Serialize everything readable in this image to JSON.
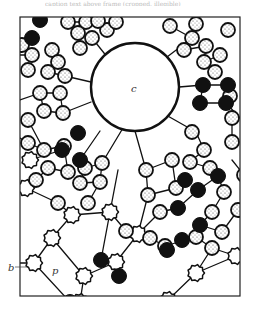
{
  "figure": {
    "type": "schematic illustration of particle network",
    "frame": {
      "x": 20,
      "y": 17,
      "width": 220,
      "height": 279
    },
    "colors": {
      "ink": "#111111",
      "background": "#ffffff",
      "stipple": "#555555",
      "label": "#333333"
    },
    "labels": {
      "c": {
        "text": "c",
        "x": 131,
        "y": 92
      },
      "b": {
        "text": "b",
        "x": 8,
        "y": 271
      },
      "p": {
        "text": "p",
        "x": 52,
        "y": 274
      }
    },
    "large_particle": {
      "id": "c",
      "cx": 135,
      "cy": 87,
      "r": 44
    },
    "stippled_particles": [
      [
        68,
        22
      ],
      [
        86,
        22
      ],
      [
        78,
        33
      ],
      [
        92,
        38
      ],
      [
        80,
        48
      ],
      [
        107,
        30
      ],
      [
        116,
        22
      ],
      [
        98,
        21
      ],
      [
        22,
        45
      ],
      [
        32,
        55
      ],
      [
        28,
        70
      ],
      [
        52,
        50
      ],
      [
        58,
        62
      ],
      [
        48,
        72
      ],
      [
        65,
        76
      ],
      [
        40,
        93
      ],
      [
        60,
        93
      ],
      [
        44,
        111
      ],
      [
        63,
        113
      ],
      [
        28,
        120
      ],
      [
        28,
        143
      ],
      [
        44,
        150
      ],
      [
        64,
        146
      ],
      [
        48,
        168
      ],
      [
        68,
        172
      ],
      [
        36,
        180
      ],
      [
        85,
        168
      ],
      [
        102,
        163
      ],
      [
        100,
        182
      ],
      [
        80,
        183
      ],
      [
        88,
        203
      ],
      [
        58,
        203
      ],
      [
        170,
        26
      ],
      [
        192,
        38
      ],
      [
        184,
        50
      ],
      [
        206,
        46
      ],
      [
        204,
        62
      ],
      [
        220,
        55
      ],
      [
        215,
        72
      ],
      [
        228,
        30
      ],
      [
        196,
        24
      ],
      [
        230,
        96
      ],
      [
        232,
        118
      ],
      [
        232,
        142
      ],
      [
        192,
        132
      ],
      [
        204,
        150
      ],
      [
        190,
        162
      ],
      [
        210,
        168
      ],
      [
        146,
        170
      ],
      [
        172,
        160
      ],
      [
        148,
        195
      ],
      [
        176,
        188
      ],
      [
        224,
        192
      ],
      [
        212,
        212
      ],
      [
        222,
        232
      ],
      [
        238,
        210
      ],
      [
        126,
        231
      ],
      [
        160,
        212
      ],
      [
        150,
        238
      ],
      [
        165,
        246
      ],
      [
        196,
        237
      ],
      [
        212,
        248
      ],
      [
        244,
        175
      ]
    ],
    "solid_particles": [
      [
        40,
        20
      ],
      [
        32,
        38
      ],
      [
        203,
        85
      ],
      [
        228,
        85
      ],
      [
        200,
        103
      ],
      [
        226,
        103
      ],
      [
        78,
        133
      ],
      [
        62,
        150
      ],
      [
        80,
        160
      ],
      [
        185,
        180
      ],
      [
        178,
        208
      ],
      [
        218,
        176
      ],
      [
        200,
        225
      ],
      [
        101,
        260
      ],
      [
        119,
        276
      ],
      [
        167,
        250
      ],
      [
        182,
        240
      ],
      [
        70,
        302
      ],
      [
        198,
        190
      ]
    ],
    "spiky_particles": [
      [
        30,
        160
      ],
      [
        72,
        215
      ],
      [
        110,
        212
      ],
      [
        52,
        238
      ],
      [
        34,
        263
      ],
      [
        84,
        276
      ],
      [
        138,
        234
      ],
      [
        116,
        262
      ],
      [
        80,
        302
      ],
      [
        196,
        273
      ],
      [
        236,
        256
      ],
      [
        26,
        188
      ],
      [
        168,
        300
      ]
    ],
    "bonds": [
      [
        70,
        22,
        86,
        22
      ],
      [
        78,
        33,
        92,
        38
      ],
      [
        92,
        38,
        80,
        48
      ],
      [
        52,
        50,
        58,
        62
      ],
      [
        58,
        62,
        48,
        72
      ],
      [
        48,
        72,
        65,
        76
      ],
      [
        65,
        76,
        91,
        82
      ],
      [
        40,
        93,
        60,
        93
      ],
      [
        60,
        93,
        63,
        113
      ],
      [
        63,
        113,
        44,
        111
      ],
      [
        44,
        111,
        40,
        93
      ],
      [
        63,
        113,
        91,
        102
      ],
      [
        28,
        120,
        44,
        150
      ],
      [
        44,
        150,
        64,
        146
      ],
      [
        64,
        146,
        68,
        172
      ],
      [
        68,
        172,
        48,
        168
      ],
      [
        48,
        168,
        36,
        180
      ],
      [
        28,
        143,
        44,
        150
      ],
      [
        86,
        168,
        102,
        163
      ],
      [
        102,
        163,
        100,
        182
      ],
      [
        100,
        182,
        80,
        183
      ],
      [
        80,
        183,
        85,
        168
      ],
      [
        88,
        203,
        100,
        182
      ],
      [
        135,
        131,
        146,
        170
      ],
      [
        146,
        170,
        172,
        160
      ],
      [
        172,
        160,
        176,
        188
      ],
      [
        176,
        188,
        148,
        195
      ],
      [
        148,
        195,
        146,
        170
      ],
      [
        179,
        87,
        203,
        85
      ],
      [
        203,
        85,
        228,
        85
      ],
      [
        228,
        85,
        226,
        103
      ],
      [
        226,
        103,
        200,
        103
      ],
      [
        200,
        103,
        203,
        85
      ],
      [
        170,
        26,
        192,
        38
      ],
      [
        192,
        38,
        184,
        50
      ],
      [
        184,
        50,
        206,
        46
      ],
      [
        206,
        46,
        204,
        62
      ],
      [
        204,
        62,
        220,
        55
      ],
      [
        167,
        57,
        192,
        38
      ],
      [
        166,
        115,
        196,
        132
      ],
      [
        196,
        132,
        204,
        150
      ],
      [
        204,
        150,
        190,
        162
      ],
      [
        190,
        162,
        210,
        168
      ],
      [
        232,
        118,
        232,
        142
      ],
      [
        226,
        103,
        240,
        118
      ],
      [
        30,
        160,
        62,
        150
      ],
      [
        26,
        188,
        58,
        203
      ],
      [
        58,
        203,
        72,
        215
      ],
      [
        72,
        215,
        110,
        212
      ],
      [
        110,
        212,
        126,
        231
      ],
      [
        126,
        231,
        150,
        238
      ],
      [
        150,
        238,
        165,
        246
      ],
      [
        165,
        246,
        196,
        237
      ],
      [
        196,
        237,
        212,
        248
      ],
      [
        212,
        248,
        236,
        256
      ],
      [
        52,
        238,
        72,
        215
      ],
      [
        52,
        238,
        34,
        263
      ],
      [
        34,
        263,
        20,
        263
      ],
      [
        34,
        263,
        70,
        302
      ],
      [
        52,
        238,
        84,
        276
      ],
      [
        84,
        276,
        116,
        262
      ],
      [
        116,
        262,
        138,
        234
      ],
      [
        138,
        234,
        160,
        212
      ],
      [
        160,
        212,
        178,
        208
      ],
      [
        116,
        262,
        119,
        276
      ],
      [
        84,
        276,
        80,
        302
      ],
      [
        196,
        273,
        212,
        248
      ],
      [
        196,
        273,
        236,
        256
      ],
      [
        196,
        273,
        168,
        300
      ],
      [
        110,
        212,
        101,
        260
      ],
      [
        118,
        170,
        110,
        212
      ],
      [
        123,
        128,
        102,
        163
      ],
      [
        100,
        131,
        80,
        160
      ],
      [
        178,
        208,
        198,
        190
      ],
      [
        198,
        190,
        218,
        176
      ],
      [
        218,
        176,
        224,
        192
      ],
      [
        224,
        192,
        212,
        212
      ],
      [
        212,
        212,
        200,
        225
      ],
      [
        200,
        225,
        222,
        232
      ],
      [
        222,
        232,
        238,
        210
      ],
      [
        20,
        100,
        40,
        93
      ],
      [
        20,
        138,
        28,
        143
      ],
      [
        20,
        55,
        32,
        55
      ],
      [
        92,
        38,
        108,
        58
      ],
      [
        148,
        195,
        138,
        234
      ],
      [
        176,
        188,
        185,
        180
      ],
      [
        244,
        175,
        232,
        160
      ]
    ],
    "top_caption": "caption text above frame (cropped, illegible)"
  }
}
